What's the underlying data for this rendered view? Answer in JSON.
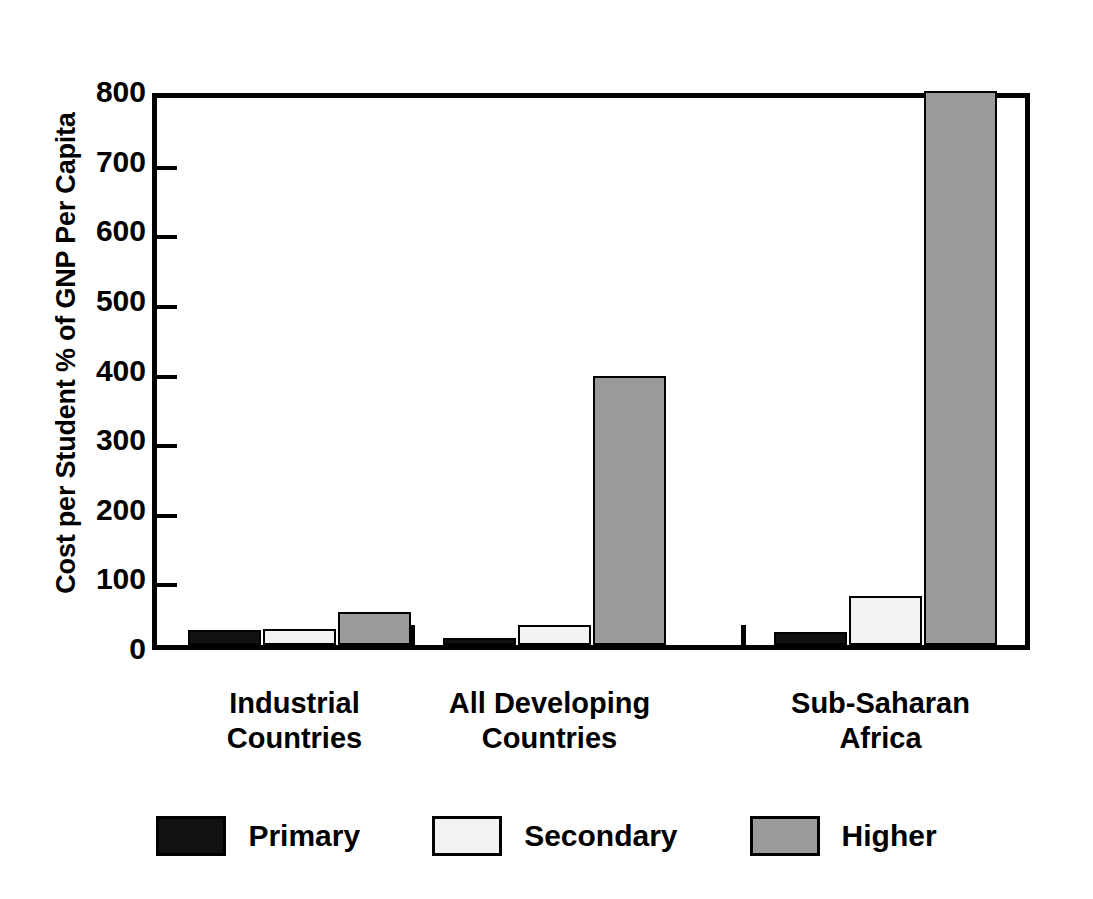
{
  "chart_data": {
    "type": "bar",
    "title": "",
    "subtitle": "",
    "xlabel": "",
    "ylabel": "Cost per Student % of GNP Per Capita",
    "ylim": [
      0,
      800
    ],
    "yticks": [
      0,
      100,
      200,
      300,
      400,
      500,
      600,
      700,
      800
    ],
    "ytick_labels": [
      "0",
      "100",
      "200",
      "300",
      "400",
      "500",
      "600",
      "700",
      "800"
    ],
    "grid": false,
    "legend_position": "bottom",
    "categories": [
      "Industrial Countries",
      "All Developing Countries",
      "Sub-Saharan Africa"
    ],
    "category_lines": [
      [
        "Industrial",
        "Countries"
      ],
      [
        "All Developing",
        "Countries"
      ],
      [
        "Sub-Saharan",
        "Africa"
      ]
    ],
    "series": [
      {
        "name": "Primary",
        "color": "#111111",
        "values": [
          22,
          10,
          19
        ]
      },
      {
        "name": "Secondary",
        "color": "#f2f2f2",
        "values": [
          23,
          29,
          70
        ]
      },
      {
        "name": "Higher",
        "color": "#9a9a9a",
        "values": [
          48,
          387,
          795
        ]
      }
    ],
    "annotations": []
  },
  "legend": {
    "items": [
      {
        "label": "Primary",
        "swatch": "primary-swatch"
      },
      {
        "label": "Secondary",
        "swatch": "secondary-swatch"
      },
      {
        "label": "Higher",
        "swatch": "higher-swatch"
      }
    ]
  },
  "axis": {
    "y_title": "Cost per Student % of GNP Per Capita"
  }
}
